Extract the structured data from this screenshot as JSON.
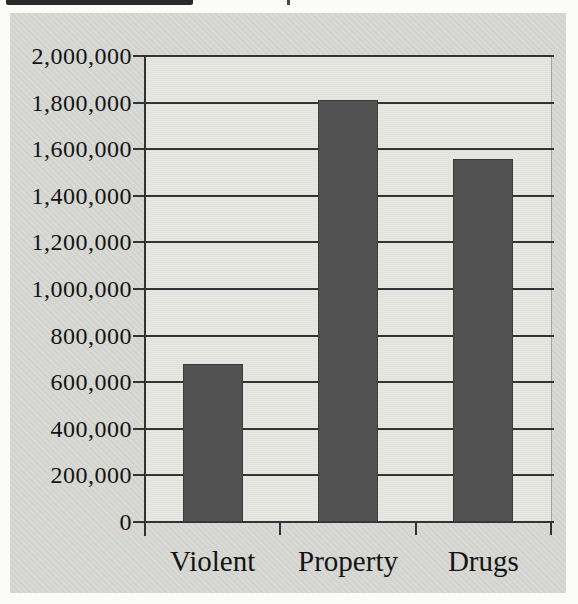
{
  "page": {
    "note_visible_text_only": "scanned bar chart, title cropped out of frame",
    "colors": {
      "page_bg": "#fbfbf8",
      "panel_bg": "#d7d7d3",
      "plot_bg": "#e6e6e1",
      "bar_fill": "#525252",
      "bar_edge": "#3b3b3b",
      "gridline": "#333333",
      "text": "#141414",
      "crop_fragment": "#2a2a2a"
    }
  },
  "chart_data": {
    "type": "bar",
    "title": "",
    "xlabel": "",
    "ylabel": "",
    "categories": [
      "Violent",
      "Property",
      "Drugs"
    ],
    "values": [
      680000,
      1810000,
      1560000
    ],
    "ylim": [
      0,
      2000000
    ],
    "ytick_step": 200000,
    "ytick_labels": [
      "0",
      "200,000",
      "400,000",
      "600,000",
      "800,000",
      "1,000,000",
      "1,200,000",
      "1,400,000",
      "1,600,000",
      "1,800,000",
      "2,000,000"
    ],
    "grid": true,
    "legend": false,
    "bar_color": "#525252"
  }
}
